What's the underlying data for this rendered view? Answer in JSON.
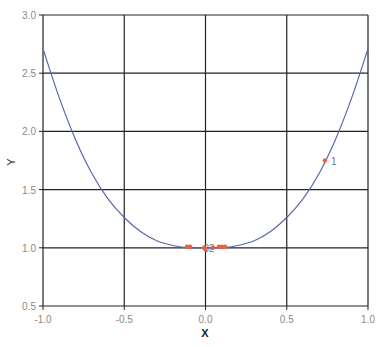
{
  "chart_data": {
    "type": "scatter",
    "title": "",
    "xlabel": "X",
    "ylabel": "Y",
    "xlim": [
      -1.0,
      1.0
    ],
    "ylim": [
      0.5,
      3.0
    ],
    "grid": true,
    "legend": "none",
    "x_ticks": [
      "-1.0",
      "-0.5",
      "0.0",
      "0.5",
      "1.0"
    ],
    "y_ticks": [
      "0.5",
      "1.0",
      "1.5",
      "2.0",
      "2.5",
      "3.0"
    ],
    "series": [
      {
        "name": "fitted curve",
        "kind": "line",
        "color": "#5a67b0",
        "x": [
          -1.0,
          -0.9,
          -0.8,
          -0.7,
          -0.6,
          -0.5,
          -0.4,
          -0.3,
          -0.2,
          -0.1,
          0.0,
          0.1,
          0.2,
          0.3,
          0.4,
          0.5,
          0.6,
          0.7,
          0.8,
          0.9,
          1.0
        ],
        "y": [
          2.71,
          2.29,
          1.93,
          1.64,
          1.42,
          1.26,
          1.14,
          1.06,
          1.02,
          1.0,
          1.0,
          1.0,
          1.02,
          1.06,
          1.14,
          1.26,
          1.42,
          1.64,
          1.93,
          2.29,
          2.71
        ]
      },
      {
        "name": "points",
        "kind": "scatter",
        "color": "#f0603a",
        "x": [
          0.735,
          -0.114,
          -0.095,
          -0.009,
          0.0,
          0.046,
          0.083,
          0.101,
          0.12
        ],
        "y": [
          1.75,
          1.01,
          1.01,
          1.0,
          0.99,
          1.0,
          1.01,
          1.01,
          1.01
        ]
      }
    ],
    "annotations": [
      {
        "text": "1",
        "x": 0.735,
        "y": 1.75
      },
      {
        "text": "32",
        "x": -0.05,
        "y": 1.0
      }
    ]
  }
}
